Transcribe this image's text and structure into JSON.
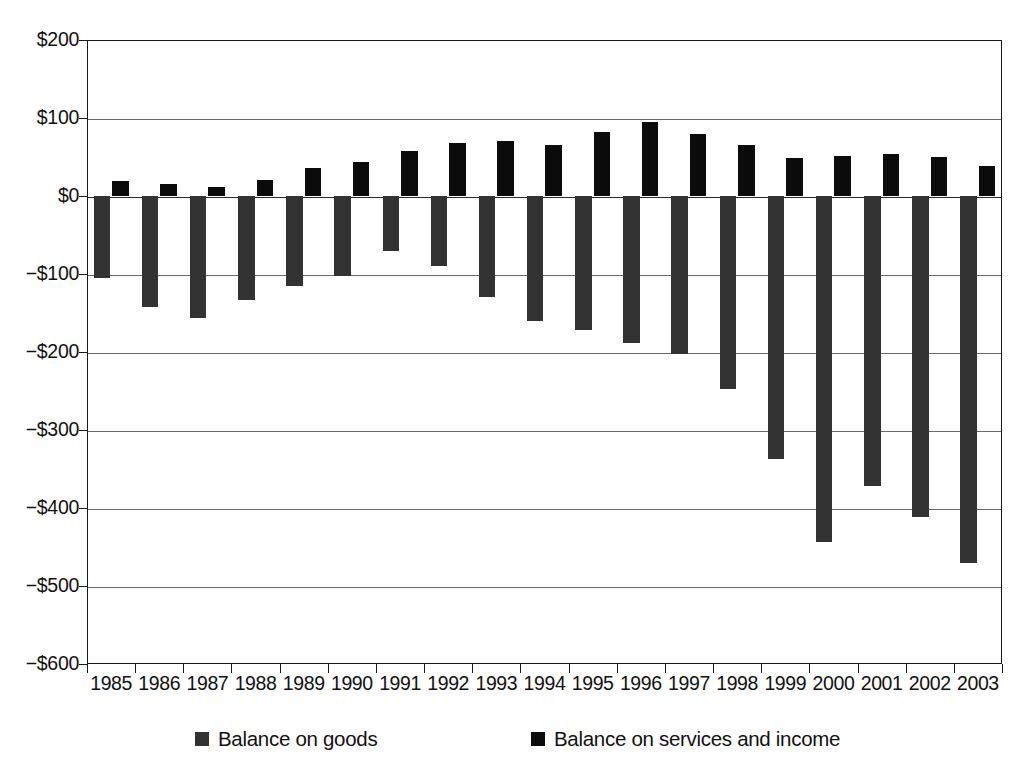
{
  "chart_data": {
    "type": "bar",
    "title": "",
    "xlabel": "",
    "ylabel": "",
    "grid": true,
    "legend_position": "bottom",
    "ylim": [
      -600,
      200
    ],
    "ytick_step": 100,
    "yticks": [
      200,
      100,
      0,
      -100,
      -200,
      -300,
      -400,
      -500,
      -600
    ],
    "ytick_labels": [
      "$200",
      "$100",
      "$0",
      "−$100",
      "−$200",
      "−$300",
      "−$400",
      "−$500",
      "−$600"
    ],
    "categories": [
      "1985",
      "1986",
      "1987",
      "1988",
      "1989",
      "1990",
      "1991",
      "1992",
      "1993",
      "1994",
      "1995",
      "1996",
      "1997",
      "1998",
      "1999",
      "2000",
      "2001",
      "2002",
      "2003"
    ],
    "units": "billions of dollars",
    "series": [
      {
        "name": "Balance on goods",
        "color": "#333333",
        "values": [
          -105,
          -142,
          -157,
          -133,
          -116,
          -102,
          -70,
          -90,
          -129,
          -160,
          -172,
          -188,
          -203,
          -247,
          -337,
          -443,
          -372,
          -412,
          -470
        ]
      },
      {
        "name": "Balance on services and income",
        "color": "#0b0b0b",
        "values": [
          19,
          15,
          12,
          20,
          36,
          44,
          58,
          68,
          70,
          65,
          82,
          95,
          79,
          65,
          49,
          51,
          54,
          50,
          38
        ]
      }
    ]
  },
  "legend": {
    "items": [
      {
        "label": "Balance on goods",
        "swatch_color": "#333333"
      },
      {
        "label": "Balance on services and income",
        "swatch_color": "#0b0b0b"
      }
    ]
  },
  "header_remnant": ""
}
